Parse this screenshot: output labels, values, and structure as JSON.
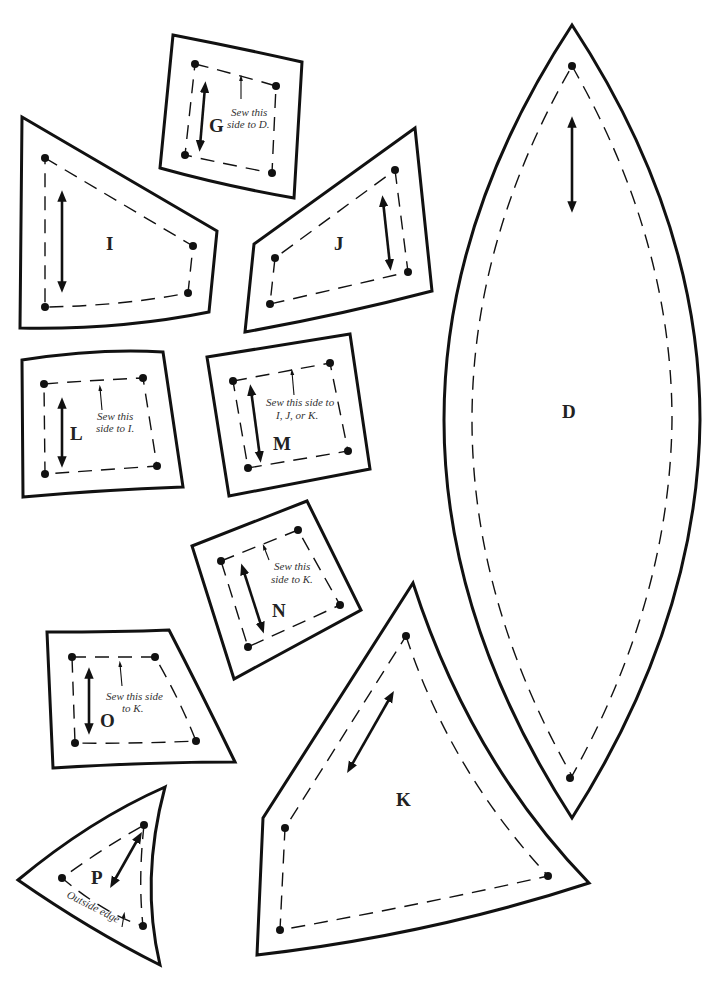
{
  "sheet": {
    "type": "quilt/sewing pattern pieces",
    "background": "#ffffff",
    "line_color": "#111111"
  },
  "pieces": {
    "G": {
      "label": "G",
      "note": [
        "Sew this",
        "side to D."
      ]
    },
    "I": {
      "label": "I"
    },
    "J": {
      "label": "J"
    },
    "D": {
      "label": "D"
    },
    "L": {
      "label": "L",
      "note": [
        "Sew this",
        "side to I."
      ]
    },
    "M": {
      "label": "M",
      "note": [
        "Sew this side to",
        "I, J, or K."
      ]
    },
    "N": {
      "label": "N",
      "note": [
        "Sew this",
        "side to K."
      ]
    },
    "O": {
      "label": "O",
      "note": [
        "Sew this side",
        "to K."
      ]
    },
    "K": {
      "label": "K"
    },
    "P": {
      "label": "P",
      "note": [
        "Outside edge"
      ]
    }
  },
  "legend": {
    "solid_line": "cutting line",
    "dashed_line": "sewing line",
    "double_arrow": "grain line",
    "dot": "seam corner"
  }
}
